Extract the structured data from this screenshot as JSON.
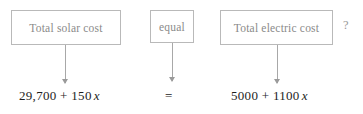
{
  "diagram": {
    "type": "word-equation-to-algebra",
    "boxes": [
      {
        "id": "solar",
        "label": "Total solar cost"
      },
      {
        "id": "equal",
        "label": "equal"
      },
      {
        "id": "electric",
        "label": "Total electric cost"
      }
    ],
    "question_mark": "?",
    "expressions": [
      {
        "id": "solar",
        "text": "29,700 + 150",
        "variable": "x"
      },
      {
        "id": "equal",
        "text": "=",
        "variable": ""
      },
      {
        "id": "electric",
        "text": "5000 + 1100",
        "variable": "x"
      }
    ],
    "colors": {
      "box_border": "#b9b9b9",
      "box_text": "#8a8a8a",
      "arrow": "#a8a8a8",
      "expression_text": "#1d1d1d",
      "background": "#ffffff"
    }
  }
}
